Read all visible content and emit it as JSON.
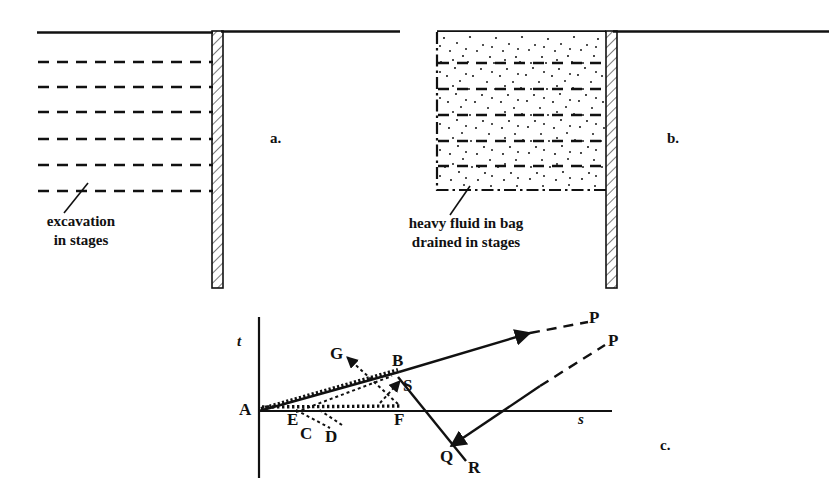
{
  "figure": {
    "kind": "engineering-diagram",
    "panels": [
      {
        "id": "a",
        "letter": "a.",
        "caption": "excavation\nin stages",
        "caption_line_1": "excavation",
        "caption_line_2": "in stages",
        "description": "retaining wall with excavation in stages shown as dashed levels"
      },
      {
        "id": "b",
        "letter": "b.",
        "caption": "heavy fluid in bag\ndrained in stages",
        "caption_line_1": "heavy fluid in bag",
        "caption_line_2": "drained in stages",
        "description": "retaining wall with stippled heavy fluid bag drained in stages"
      },
      {
        "id": "c",
        "letter": "c.",
        "description": "stress path plot in s-t space"
      }
    ]
  },
  "panel_a": {
    "letter": "a.",
    "caption_line_1": "excavation",
    "caption_line_2": "in stages",
    "stage_count": 6,
    "wall_label": "retaining-wall"
  },
  "panel_b": {
    "letter": "b.",
    "caption_line_1": "heavy fluid in bag",
    "caption_line_2": "drained in stages",
    "stage_count": 5,
    "bag_label": "heavy-fluid-bag"
  },
  "panel_c": {
    "letter": "c.",
    "axis_t": "t",
    "axis_s": "s",
    "points": [
      {
        "id": "A",
        "label": "A"
      },
      {
        "id": "B",
        "label": "B"
      },
      {
        "id": "C",
        "label": "C"
      },
      {
        "id": "D",
        "label": "D"
      },
      {
        "id": "E",
        "label": "E"
      },
      {
        "id": "F",
        "label": "F"
      },
      {
        "id": "G",
        "label": "G"
      },
      {
        "id": "S",
        "label": "S"
      },
      {
        "id": "Q",
        "label": "Q"
      },
      {
        "id": "R",
        "label": "R"
      },
      {
        "id": "P1",
        "label": "P"
      },
      {
        "id": "P2",
        "label": "P"
      }
    ]
  },
  "colors": {
    "ink": "#111111",
    "background": "#ffffff",
    "stipple": "#222222"
  }
}
